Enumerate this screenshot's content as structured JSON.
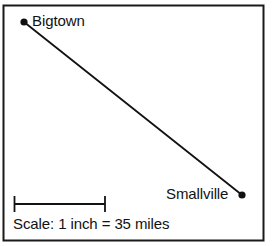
{
  "figure": {
    "type": "scale-map-diagram",
    "border_color": "#1a1a1a",
    "background_color": "#ffffff",
    "ink_color": "#121212"
  },
  "places": [
    {
      "id": "bigtown",
      "label": "Bigtown",
      "marker": "map-point-dot",
      "x": 24,
      "y": 22
    },
    {
      "id": "smallville",
      "label": "Smallville",
      "marker": "map-point-dot",
      "x": 242,
      "y": 195
    }
  ],
  "route": {
    "name": "bigtown-to-smallville-line",
    "from": "bigtown",
    "to": "smallville",
    "x1": 24,
    "y1": 22,
    "x2": 242,
    "y2": 195
  },
  "scale": {
    "caption": "Scale: 1 inch = 35 miles",
    "unit_label": "1 inch",
    "distance_label": "35 miles",
    "bar_x1": 14,
    "bar_x2": 105,
    "bar_y": 204
  }
}
